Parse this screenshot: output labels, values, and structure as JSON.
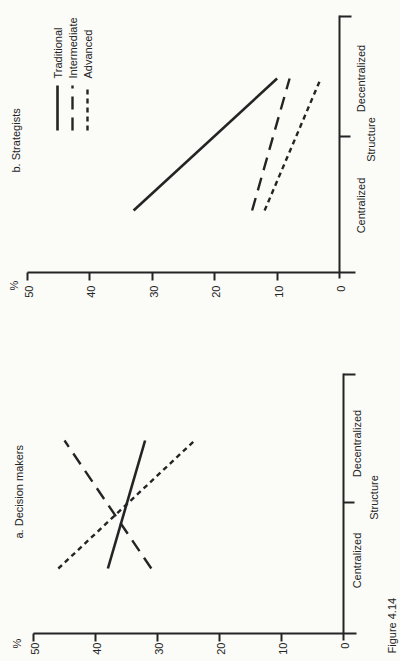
{
  "page": {
    "background": "#fbfbf8",
    "ink": "#242424",
    "caption": "Figure 4.14"
  },
  "chart_data": [
    {
      "id": "a",
      "type": "line",
      "title": "a. Decision makers",
      "ylabel": "%",
      "xlabel": "Structure",
      "categories": [
        "Centralized",
        "Decentralized"
      ],
      "ylim": [
        0,
        50
      ],
      "yticks": [
        0,
        10,
        20,
        30,
        40,
        50
      ],
      "grid": false,
      "legend_position": "none",
      "series": [
        {
          "name": "Traditional",
          "line_style": "solid",
          "values": [
            38,
            32
          ]
        },
        {
          "name": "Intermediate",
          "line_style": "long-dash",
          "values": [
            31,
            45
          ]
        },
        {
          "name": "Advanced",
          "line_style": "short-dash",
          "values": [
            46,
            24
          ]
        }
      ]
    },
    {
      "id": "b",
      "type": "line",
      "title": "b. Strategists",
      "ylabel": "%",
      "xlabel": "Structure",
      "categories": [
        "Centralized",
        "Decentralized"
      ],
      "ylim": [
        0,
        50
      ],
      "yticks": [
        0,
        10,
        20,
        30,
        40,
        50
      ],
      "grid": false,
      "legend_position": "top-left",
      "series": [
        {
          "name": "Traditional",
          "line_style": "solid",
          "values": [
            33,
            10
          ]
        },
        {
          "name": "Intermediate",
          "line_style": "long-dash",
          "values": [
            14,
            8
          ]
        },
        {
          "name": "Advanced",
          "line_style": "short-dash",
          "values": [
            12,
            3
          ]
        }
      ]
    }
  ]
}
